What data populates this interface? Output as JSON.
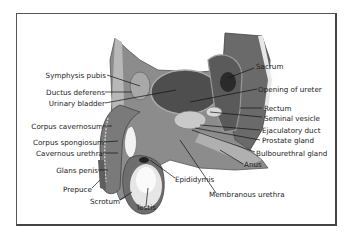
{
  "diagram": {
    "labels_left": [
      {
        "id": "symphysis",
        "text": "Symphysis pubis"
      },
      {
        "id": "ductus",
        "text": "Ductus deferens"
      },
      {
        "id": "bladder",
        "text": "Urinary bladder"
      },
      {
        "id": "cavernosum",
        "text": "Corpus cavernosum"
      },
      {
        "id": "spongiosum",
        "text": "Corpus spongiosum"
      },
      {
        "id": "cav_urethra",
        "text": "Cavernous urethra"
      },
      {
        "id": "glans",
        "text": "Glans penis"
      },
      {
        "id": "prepuce",
        "text": "Prepuce"
      },
      {
        "id": "scrotum",
        "text": "Scrotum"
      },
      {
        "id": "testis",
        "text": "Testis"
      }
    ],
    "labels_right": [
      {
        "id": "sacrum",
        "text": "Sacrum"
      },
      {
        "id": "ureter",
        "text": "Opening of ureter"
      },
      {
        "id": "rectum",
        "text": "Rectum"
      },
      {
        "id": "seminal",
        "text": "Seminal vesicle"
      },
      {
        "id": "ejac",
        "text": "Ejaculatory duct"
      },
      {
        "id": "prostate",
        "text": "Prostate gland"
      },
      {
        "id": "bulbo",
        "text": "Bulbourethral gland"
      },
      {
        "id": "anus",
        "text": "Anus"
      },
      {
        "id": "epididymis",
        "text": "Epididymis"
      },
      {
        "id": "memb_urethra",
        "text": "Membranous urethra"
      }
    ]
  }
}
